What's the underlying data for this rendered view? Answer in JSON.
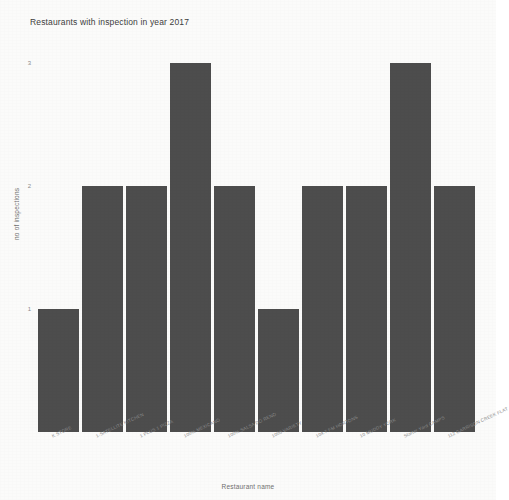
{
  "chart_data": {
    "type": "bar",
    "title": "Restaurants with inspection in year 2017",
    "xlabel": "Restaurant name",
    "ylabel": "no of inspections",
    "categories": [
      "K STORE",
      "1-SATELLITE KITCHEN",
      "1 PLUS 1 PIZZA",
      "100% MEXICANO",
      "100% SALSA DO RENO",
      "1000 VARIETY",
      "104.7 FM HORTONS",
      "10 MUDDY YORK",
      "Starter Yard CAMPS",
      "112 GARRISON CREEK FLAT"
    ],
    "values": [
      1,
      2,
      2,
      3,
      2,
      1,
      2,
      2,
      3,
      2
    ],
    "ylim": [
      0,
      3.25
    ],
    "yticks": [
      1,
      2,
      3
    ],
    "ytick_labels": [
      "1",
      "2",
      "3"
    ],
    "grid": false,
    "legend": false,
    "bar_color": "#4d4d4d",
    "background_color": "#fbfbfa"
  }
}
